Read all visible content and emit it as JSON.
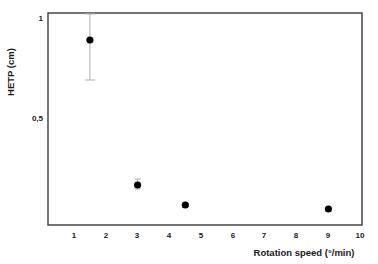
{
  "chart_data": {
    "type": "scatter",
    "title": "",
    "xlabel": "Rotation speed (°/min)",
    "ylabel": "HETP (cm)",
    "xlim": [
      0.5,
      10.4
    ],
    "ylim": [
      0.0,
      1.02
    ],
    "grid": false,
    "legend": null,
    "x_ticks": [
      1,
      2,
      3,
      4,
      5,
      6,
      7,
      8,
      9,
      10
    ],
    "x_tick_labels": [
      "1",
      "2",
      "3",
      "4",
      "5",
      "6",
      "7",
      "8",
      "9",
      "10"
    ],
    "y_ticks": [
      0.5,
      1.0
    ],
    "y_tick_labels": [
      "0,5",
      "1"
    ],
    "marker": "filled-circle",
    "marker_color": "#000000",
    "errorbar_color": "#b4b4b4",
    "frame_color": "#3a3a3a",
    "series": [
      {
        "name": "HETP vs rotation speed",
        "x": [
          1.5,
          3.0,
          4.5,
          9.0
        ],
        "y": [
          0.89,
          0.165,
          0.065,
          0.045
        ],
        "yerr_low": [
          0.2,
          0.02,
          0.012,
          0.0
        ],
        "yerr_high": [
          0.13,
          0.03,
          0.012,
          0.0
        ]
      }
    ],
    "points": [
      {
        "x": 1.5,
        "y": 0.89,
        "err_low": 0.69,
        "err_high": 1.02
      },
      {
        "x": 3.0,
        "y": 0.165,
        "err_low": 0.145,
        "err_high": 0.195
      },
      {
        "x": 4.5,
        "y": 0.065,
        "err_low": 0.053,
        "err_high": 0.077
      },
      {
        "x": 9.0,
        "y": 0.045,
        "err_low": 0.045,
        "err_high": 0.045
      }
    ]
  },
  "labels": {
    "x_axis_title": "Rotation speed (°/min)",
    "y_axis_title": "HETP (cm)",
    "y_tick_top": "1",
    "y_tick_mid": "0,5",
    "x_tick_1": "1",
    "x_tick_2": "2",
    "x_tick_3": "3",
    "x_tick_4": "4",
    "x_tick_5": "5",
    "x_tick_6": "6",
    "x_tick_7": "7",
    "x_tick_8": "8",
    "x_tick_9": "9",
    "x_tick_10": "10"
  }
}
